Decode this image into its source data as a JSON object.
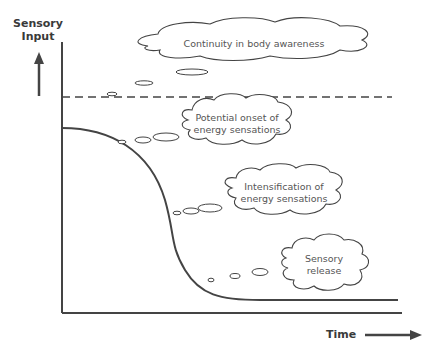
{
  "diagram": {
    "y_axis_label_line1": "Sensory",
    "y_axis_label_line2": "Input",
    "x_axis_label": "Time",
    "clouds": [
      {
        "id": "continuity",
        "line1": "Continuity in body awareness",
        "line2": ""
      },
      {
        "id": "onset",
        "line1": "Potential onset of",
        "line2": "energy sensations"
      },
      {
        "id": "intensification",
        "line1": "Intensification of",
        "line2": "energy sensations"
      },
      {
        "id": "release",
        "line1": "Sensory",
        "line2": "release"
      }
    ],
    "colors": {
      "line": "#444444",
      "text": "#555555",
      "axis_label": "#3a3a3a"
    }
  }
}
